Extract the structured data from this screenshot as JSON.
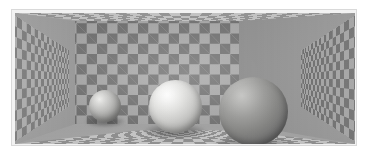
{
  "scene": {
    "title": "Checkerboard Room with Three Spheres",
    "description": "Perspective rendering of a rectangular room whose ceiling, floor and four walls are covered with a gray checkerboard texture. Three shaded spheres of increasing size rest on the floor, each appearing a different lightness.",
    "type": "3d-render",
    "image_width": 368,
    "image_height": 154,
    "background_color": "#ffffff",
    "frame": {
      "border_color": "#d9d9d9",
      "inner_mat_color": "#f2f2f2",
      "border_width_px": 1
    }
  },
  "room": {
    "surfaces": [
      {
        "name": "ceiling",
        "label": "Ceiling",
        "checker_light": "#b0b0b0",
        "checker_dark": "#6a6a6a",
        "foreshortened": true
      },
      {
        "name": "back-wall",
        "label": "Back wall",
        "checker_light": "#a6a6a6",
        "checker_dark": "#6f6f6f",
        "foreshortened": false
      },
      {
        "name": "left-wall",
        "label": "Left wall",
        "checker_light": "#9d9d9d",
        "checker_dark": "#5f5f5f",
        "foreshortened": true
      },
      {
        "name": "right-wall",
        "label": "Right wall",
        "checker_light": "#999999",
        "checker_dark": "#5a5a5a",
        "foreshortened": true
      },
      {
        "name": "floor",
        "label": "Floor",
        "checker_light": "#b8b8b8",
        "checker_dark": "#6e6e6e",
        "foreshortened": true
      }
    ],
    "vanishing_point": {
      "x": 184,
      "y": 62
    }
  },
  "spheres": [
    {
      "id": "small",
      "label": "Small sphere",
      "order": 1,
      "diameter_px": 32,
      "center": {
        "x": 105,
        "y": 106
      },
      "apparent_lightness": "light gray",
      "highlight_color": "#f2f2f0",
      "midtone_color": "#a8a8a6",
      "terminator_color": "#767674",
      "highlight_position": "upper-left"
    },
    {
      "id": "medium",
      "label": "Medium sphere",
      "order": 2,
      "diameter_px": 53,
      "center": {
        "x": 175,
        "y": 106
      },
      "apparent_lightness": "white",
      "highlight_color": "#ffffff",
      "midtone_color": "#d0d0ce",
      "terminator_color": "#939391",
      "highlight_position": "upper-left"
    },
    {
      "id": "large",
      "label": "Large sphere",
      "order": 3,
      "diameter_px": 69,
      "center": {
        "x": 253,
        "y": 111
      },
      "apparent_lightness": "dark gray",
      "highlight_color": "#c8c8c6",
      "midtone_color": "#858583",
      "terminator_color": "#595959",
      "highlight_position": "upper-left"
    }
  ],
  "shadows": [
    {
      "id": "small",
      "label": "Shadow of small sphere",
      "width_px": 40,
      "height_px": 11
    },
    {
      "id": "medium",
      "label": "Shadow of medium sphere",
      "width_px": 62,
      "height_px": 15
    },
    {
      "id": "large",
      "label": "Shadow of large sphere",
      "width_px": 80,
      "height_px": 18
    }
  ],
  "lighting": {
    "direction": "upper-left",
    "type": "diffuse-directional",
    "ambient_color": "#8a8a8a"
  }
}
